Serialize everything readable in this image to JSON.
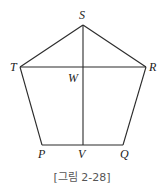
{
  "figure": {
    "caption": "[그림 2-28]",
    "shape": "pentagon",
    "vertices": {
      "S": {
        "label": "S",
        "x": 83,
        "y": 25
      },
      "T": {
        "label": "T",
        "x": 20,
        "y": 67
      },
      "R": {
        "label": "R",
        "x": 146,
        "y": 67
      },
      "Q": {
        "label": "Q",
        "x": 123,
        "y": 145
      },
      "P": {
        "label": "P",
        "x": 42,
        "y": 145
      }
    },
    "points": {
      "W": {
        "label": "W",
        "x": 83,
        "y": 67
      },
      "V": {
        "label": "V",
        "x": 83,
        "y": 145
      }
    },
    "segments": [
      "ST",
      "SR",
      "TP",
      "RQ",
      "PQ",
      "TR",
      "SV"
    ],
    "colors": {
      "line": "#2b2b2b",
      "label": "#222222",
      "caption": "#555555"
    }
  }
}
